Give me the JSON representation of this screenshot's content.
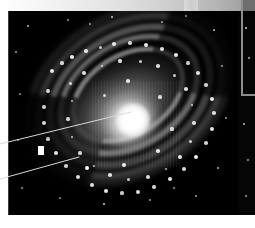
{
  "figure": {
    "type": "astronomical-image-figure",
    "background_color": "#ffffff",
    "width_px": 255,
    "height_px": 228
  },
  "colorbar": {
    "name": "grayscale-intensity-bar",
    "orientation": "horizontal",
    "position": "top",
    "x_px": 8,
    "y_px": 0,
    "width_px": 247,
    "height_px": 11,
    "gradient_from": "#fdfdfd",
    "gradient_to": "#949494",
    "end_cap_color": "#6e6e6e",
    "tick_labels": [],
    "label": ""
  },
  "image_panel": {
    "name": "galaxy-image",
    "x_px": 8,
    "y_px": 11,
    "width_px": 230,
    "height_px": 204,
    "background_color": "#000000",
    "subject": "barred spiral galaxy",
    "core": {
      "x_px": 130,
      "y_px": 113,
      "color": "#ffffff"
    },
    "disc_rotation_deg": -32,
    "arm_count": 4
  },
  "right_panel": {
    "name": "right-sky-strip",
    "x_px": 238,
    "y_px": 11,
    "width_px": 17,
    "height_px": 204,
    "background_color": "#050505"
  },
  "inset_border": {
    "name": "inset-frame-corner",
    "color": "#8d8d8d",
    "vertical_x_px": 241,
    "vertical_top_px": 0,
    "vertical_height_px": 96,
    "horizontal_y_px": 94,
    "horizontal_width_px": 14,
    "thickness_px": 2
  },
  "annotations": {
    "line_color": "#d8d8d8",
    "leaders": [
      {
        "name": "leader-line-nucleus",
        "label": "",
        "x1_px": 0,
        "y1_px": 144,
        "x2_px": 131,
        "y2_px": 112,
        "points_to": "galaxy nucleus"
      },
      {
        "name": "leader-line-spiral-arm",
        "label": "",
        "x1_px": 0,
        "y1_px": 179,
        "x2_px": 79,
        "y2_px": 157,
        "points_to": "bright knot in inner spiral arm"
      }
    ]
  },
  "foreground_object": {
    "name": "foreground-source",
    "x_px": 38,
    "y_px": 146,
    "width_px": 6,
    "height_px": 9,
    "color": "#ffffff"
  },
  "knots": [
    {
      "x": 44,
      "y": 60,
      "r": 2.0,
      "o": 0.9
    },
    {
      "x": 54,
      "y": 52,
      "r": 1.6,
      "o": 0.8
    },
    {
      "x": 64,
      "y": 46,
      "r": 2.2,
      "o": 0.95
    },
    {
      "x": 78,
      "y": 40,
      "r": 1.8,
      "o": 0.85
    },
    {
      "x": 92,
      "y": 36,
      "r": 1.5,
      "o": 0.75
    },
    {
      "x": 106,
      "y": 33,
      "r": 2.0,
      "o": 0.88
    },
    {
      "x": 122,
      "y": 32,
      "r": 1.7,
      "o": 0.8
    },
    {
      "x": 138,
      "y": 34,
      "r": 2.3,
      "o": 0.92
    },
    {
      "x": 154,
      "y": 38,
      "r": 1.9,
      "o": 0.86
    },
    {
      "x": 168,
      "y": 44,
      "r": 2.1,
      "o": 0.9
    },
    {
      "x": 180,
      "y": 52,
      "r": 1.6,
      "o": 0.78
    },
    {
      "x": 190,
      "y": 62,
      "r": 2.0,
      "o": 0.88
    },
    {
      "x": 198,
      "y": 74,
      "r": 1.7,
      "o": 0.8
    },
    {
      "x": 204,
      "y": 88,
      "r": 2.2,
      "o": 0.92
    },
    {
      "x": 206,
      "y": 102,
      "r": 1.8,
      "o": 0.84
    },
    {
      "x": 204,
      "y": 118,
      "r": 2.0,
      "o": 0.88
    },
    {
      "x": 198,
      "y": 132,
      "r": 1.7,
      "o": 0.8
    },
    {
      "x": 188,
      "y": 146,
      "r": 2.3,
      "o": 0.93
    },
    {
      "x": 176,
      "y": 158,
      "r": 1.9,
      "o": 0.86
    },
    {
      "x": 162,
      "y": 168,
      "r": 2.1,
      "o": 0.9
    },
    {
      "x": 146,
      "y": 176,
      "r": 1.7,
      "o": 0.8
    },
    {
      "x": 130,
      "y": 181,
      "r": 2.0,
      "o": 0.87
    },
    {
      "x": 114,
      "y": 182,
      "r": 1.6,
      "o": 0.78
    },
    {
      "x": 98,
      "y": 180,
      "r": 2.2,
      "o": 0.91
    },
    {
      "x": 84,
      "y": 174,
      "r": 1.8,
      "o": 0.83
    },
    {
      "x": 70,
      "y": 166,
      "r": 2.0,
      "o": 0.87
    },
    {
      "x": 58,
      "y": 155,
      "r": 1.7,
      "o": 0.8
    },
    {
      "x": 48,
      "y": 142,
      "r": 2.1,
      "o": 0.89
    },
    {
      "x": 40,
      "y": 128,
      "r": 1.6,
      "o": 0.76
    },
    {
      "x": 36,
      "y": 112,
      "r": 1.9,
      "o": 0.84
    },
    {
      "x": 36,
      "y": 96,
      "r": 1.7,
      "o": 0.79
    },
    {
      "x": 40,
      "y": 80,
      "r": 2.0,
      "o": 0.86
    },
    {
      "x": 62,
      "y": 72,
      "r": 1.5,
      "o": 0.8
    },
    {
      "x": 76,
      "y": 62,
      "r": 1.7,
      "o": 0.84
    },
    {
      "x": 94,
      "y": 55,
      "r": 1.4,
      "o": 0.76
    },
    {
      "x": 112,
      "y": 50,
      "r": 1.8,
      "o": 0.86
    },
    {
      "x": 132,
      "y": 50,
      "r": 1.5,
      "o": 0.78
    },
    {
      "x": 150,
      "y": 55,
      "r": 1.7,
      "o": 0.83
    },
    {
      "x": 166,
      "y": 64,
      "r": 1.5,
      "o": 0.77
    },
    {
      "x": 178,
      "y": 78,
      "r": 1.8,
      "o": 0.85
    },
    {
      "x": 184,
      "y": 94,
      "r": 1.4,
      "o": 0.74
    },
    {
      "x": 186,
      "y": 112,
      "r": 1.7,
      "o": 0.82
    },
    {
      "x": 182,
      "y": 130,
      "r": 1.5,
      "o": 0.78
    },
    {
      "x": 172,
      "y": 146,
      "r": 1.8,
      "o": 0.85
    },
    {
      "x": 158,
      "y": 158,
      "r": 1.4,
      "o": 0.74
    },
    {
      "x": 140,
      "y": 166,
      "r": 1.7,
      "o": 0.82
    },
    {
      "x": 120,
      "y": 168,
      "r": 1.5,
      "o": 0.77
    },
    {
      "x": 102,
      "y": 164,
      "r": 1.8,
      "o": 0.84
    },
    {
      "x": 86,
      "y": 155,
      "r": 1.4,
      "o": 0.74
    },
    {
      "x": 72,
      "y": 142,
      "r": 1.6,
      "o": 0.8
    },
    {
      "x": 64,
      "y": 126,
      "r": 1.4,
      "o": 0.75
    },
    {
      "x": 60,
      "y": 108,
      "r": 1.6,
      "o": 0.8
    },
    {
      "x": 64,
      "y": 90,
      "r": 1.4,
      "o": 0.74
    },
    {
      "x": 79,
      "y": 157,
      "r": 2.4,
      "o": 1.0
    },
    {
      "x": 116,
      "y": 154,
      "r": 2.0,
      "o": 0.9
    },
    {
      "x": 150,
      "y": 140,
      "r": 1.8,
      "o": 0.86
    },
    {
      "x": 164,
      "y": 118,
      "r": 1.6,
      "o": 0.8
    },
    {
      "x": 152,
      "y": 86,
      "r": 1.6,
      "o": 0.8
    },
    {
      "x": 120,
      "y": 70,
      "r": 1.8,
      "o": 0.85
    },
    {
      "x": 96,
      "y": 84,
      "r": 1.5,
      "o": 0.78
    }
  ],
  "stars": [
    {
      "x": 28,
      "y": 26,
      "r": 1.0,
      "o": 0.7
    },
    {
      "x": 68,
      "y": 20,
      "r": 0.9,
      "o": 0.6
    },
    {
      "x": 112,
      "y": 17,
      "r": 1.1,
      "o": 0.75
    },
    {
      "x": 162,
      "y": 22,
      "r": 0.9,
      "o": 0.62
    },
    {
      "x": 214,
      "y": 30,
      "r": 1.1,
      "o": 0.72
    },
    {
      "x": 222,
      "y": 66,
      "r": 0.9,
      "o": 0.6
    },
    {
      "x": 226,
      "y": 118,
      "r": 1.0,
      "o": 0.66
    },
    {
      "x": 218,
      "y": 168,
      "r": 1.0,
      "o": 0.68
    },
    {
      "x": 196,
      "y": 196,
      "r": 1.0,
      "o": 0.66
    },
    {
      "x": 150,
      "y": 200,
      "r": 0.9,
      "o": 0.6
    },
    {
      "x": 104,
      "y": 204,
      "r": 1.2,
      "o": 0.8
    },
    {
      "x": 60,
      "y": 198,
      "r": 0.9,
      "o": 0.58
    },
    {
      "x": 22,
      "y": 188,
      "r": 0.9,
      "o": 0.58
    },
    {
      "x": 18,
      "y": 140,
      "r": 0.9,
      "o": 0.6
    },
    {
      "x": 20,
      "y": 94,
      "r": 0.9,
      "o": 0.58
    },
    {
      "x": 16,
      "y": 52,
      "r": 1.0,
      "o": 0.64
    },
    {
      "x": 246,
      "y": 28,
      "r": 1.2,
      "o": 0.8
    },
    {
      "x": 249,
      "y": 58,
      "r": 1.0,
      "o": 0.7
    },
    {
      "x": 244,
      "y": 124,
      "r": 1.1,
      "o": 0.72
    },
    {
      "x": 248,
      "y": 160,
      "r": 0.9,
      "o": 0.62
    },
    {
      "x": 246,
      "y": 196,
      "r": 0.9,
      "o": 0.6
    },
    {
      "x": 90,
      "y": 24,
      "r": 0.8,
      "o": 0.55
    },
    {
      "x": 186,
      "y": 16,
      "r": 0.9,
      "o": 0.58
    },
    {
      "x": 174,
      "y": 188,
      "r": 0.9,
      "o": 0.58
    }
  ]
}
